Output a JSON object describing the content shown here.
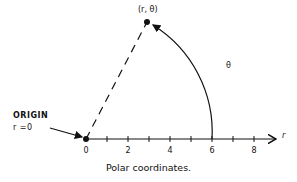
{
  "diagram": {
    "type": "polar-coordinates",
    "caption": "Polar coordinates.",
    "origin": {
      "label_line1": "ORIGIN",
      "label_line2": "r =0",
      "tick_label": "0"
    },
    "point": {
      "label": "(r, θ)"
    },
    "angle": {
      "label": "θ"
    },
    "axis": {
      "label": "r",
      "ticks": [
        {
          "value": 0,
          "label": "0"
        },
        {
          "value": 1,
          "label": ""
        },
        {
          "value": 2,
          "label": "2"
        },
        {
          "value": 3,
          "label": ""
        },
        {
          "value": 4,
          "label": "4"
        },
        {
          "value": 5,
          "label": ""
        },
        {
          "value": 6,
          "label": "6"
        },
        {
          "value": 7,
          "label": ""
        },
        {
          "value": 8,
          "label": "8"
        }
      ]
    },
    "colors": {
      "ink": "#111111",
      "background": "#ffffff"
    }
  }
}
